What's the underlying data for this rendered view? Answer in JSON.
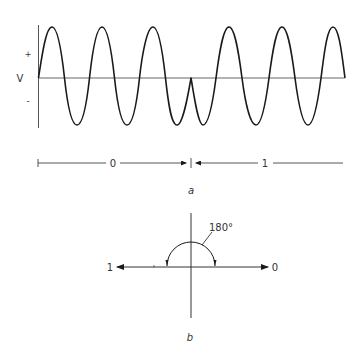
{
  "figure_a": {
    "caption": "a",
    "axis_label": "V",
    "plus_sign": "+",
    "minus_sign": "-",
    "timing_bar": {
      "bit_0_label": "0",
      "bit_1_label": "1"
    },
    "waveform": {
      "description": "Binary phase-shift keyed sinusoid; 180° phase reversal at bit boundary",
      "peaks_x": [
        52,
        102,
        153,
        229,
        282,
        333
      ],
      "troughs_x": [
        77,
        127,
        177,
        203,
        256,
        308
      ],
      "phase_reversal_x": 191
    }
  },
  "figure_b": {
    "caption": "b",
    "angle_label": "180°",
    "left_phasor_label": "1",
    "right_phasor_label": "0"
  },
  "colors": {
    "stroke": "#1a1a1a",
    "axis": "#555555",
    "text": "#333333"
  }
}
